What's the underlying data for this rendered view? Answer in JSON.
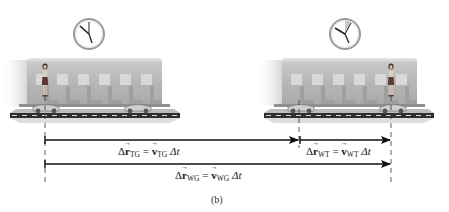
{
  "figure": {
    "caption": "(b)",
    "colors": {
      "train_body": "#b9b9b9",
      "train_window": "#d6d6d6",
      "seat": "#a4a4a4",
      "track": "#3a3a3a",
      "arrow": "#111111",
      "clock_face": "#ffffff",
      "clock_rim": "#8a8a8a"
    }
  },
  "scenes": [
    {
      "id": "initial",
      "clock": {
        "hour_hand_angle_deg": -45,
        "minute_hand_angle_deg": 0,
        "elapsed_wedge": false
      },
      "train_left_x": 27,
      "woman_x": 45,
      "woman_position": "rear of car"
    },
    {
      "id": "final",
      "clock": {
        "hour_hand_angle_deg": -55,
        "minute_hand_angle_deg": 25,
        "elapsed_wedge": true
      },
      "train_left_x": 282,
      "woman_x": 391,
      "woman_position": "front of car"
    }
  ],
  "displacements": [
    {
      "id": "TG",
      "delta": "Δ",
      "vector_symbol": "r",
      "subscript": "TG",
      "equals": "=",
      "velocity_symbol": "v",
      "velocity_subscript": "TG",
      "time": "Δt",
      "from_x": 45,
      "to_x": 299,
      "y": 140
    },
    {
      "id": "WT",
      "delta": "Δ",
      "vector_symbol": "r",
      "subscript": "WT",
      "equals": "=",
      "velocity_symbol": "v",
      "velocity_subscript": "WT",
      "time": "Δt",
      "from_x": 299,
      "to_x": 391,
      "y": 140
    },
    {
      "id": "WG",
      "delta": "Δ",
      "vector_symbol": "r",
      "subscript": "WG",
      "equals": "=",
      "velocity_symbol": "v",
      "velocity_subscript": "WG",
      "time": "Δt",
      "from_x": 45,
      "to_x": 391,
      "y": 164
    }
  ],
  "reference_lines_x": [
    45,
    299,
    391
  ]
}
